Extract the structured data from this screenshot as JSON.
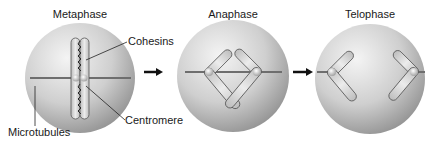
{
  "diagram": {
    "stages": [
      {
        "title": "Metaphase"
      },
      {
        "title": "Anaphase"
      },
      {
        "title": "Telophase"
      }
    ],
    "labels": {
      "cohesins": "Cohesins",
      "centromere": "Centromere",
      "microtubules": "Microtubules"
    },
    "colors": {
      "cell_light": "#f2f2f2",
      "cell_dark": "#9a9a9a",
      "chromosome_fill": "#d6d6d6",
      "chromosome_stroke": "#555555",
      "arrow": "#111111",
      "microtubule": "#6e6e6e"
    }
  }
}
